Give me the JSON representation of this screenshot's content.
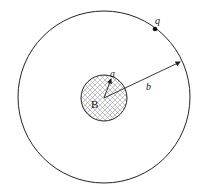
{
  "diagram": {
    "labels": {
      "center": "B",
      "inner_radius": "a",
      "outer_radius": "b",
      "charge": "q"
    },
    "colors": {
      "stroke": "#222222",
      "hatch": "#9a9a9a",
      "background": "#ffffff"
    }
  }
}
